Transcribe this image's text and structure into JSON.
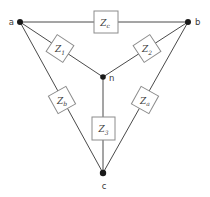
{
  "diagram": {
    "type": "delta-wye impedance network",
    "nodes": {
      "a": "a",
      "b": "b",
      "c": "c",
      "n": "n"
    },
    "impedances": {
      "z1": {
        "main": "Z",
        "sub": "1",
        "between": "a-n"
      },
      "z2": {
        "main": "Z",
        "sub": "2",
        "between": "b-n"
      },
      "z3": {
        "main": "Z",
        "sub": "3",
        "between": "n-c"
      },
      "za": {
        "main": "Z",
        "sub": "a",
        "between": "b-c"
      },
      "zb": {
        "main": "Z",
        "sub": "b",
        "between": "a-c"
      },
      "zc": {
        "main": "Z",
        "sub": "c",
        "between": "a-b"
      }
    },
    "colors": {
      "background": "#ffffff",
      "wire": "#4a4a4a",
      "box_stroke": "#8c8c8c",
      "node_fill": "#1a1a1a",
      "text": "#3a3a3a"
    }
  }
}
